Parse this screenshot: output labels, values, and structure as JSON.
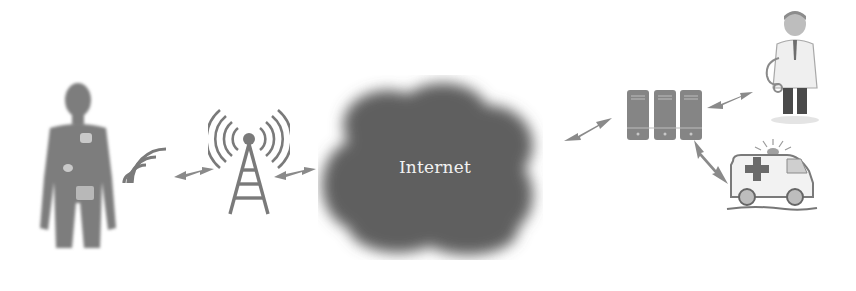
{
  "diagram": {
    "title": "",
    "nodes": [
      {
        "id": "patient",
        "label": "",
        "icon": "patient-with-body-sensors-icon"
      },
      {
        "id": "signal",
        "label": "",
        "icon": "wireless-signal-icon"
      },
      {
        "id": "tower",
        "label": "",
        "icon": "cell-tower-icon"
      },
      {
        "id": "internet",
        "label": "Internet",
        "icon": "cloud-icon"
      },
      {
        "id": "servers",
        "label": "",
        "icon": "server-rack-icon"
      },
      {
        "id": "doctor",
        "label": "",
        "icon": "doctor-icon"
      },
      {
        "id": "ambulance",
        "label": "",
        "icon": "ambulance-icon"
      }
    ],
    "edges": [
      {
        "from": "patient",
        "to": "tower",
        "style": "bidirectional-wireless"
      },
      {
        "from": "tower",
        "to": "internet",
        "style": "bidirectional-wireless"
      },
      {
        "from": "internet",
        "to": "servers",
        "style": "bidirectional-wireless"
      },
      {
        "from": "servers",
        "to": "doctor",
        "style": "bidirectional-wireless"
      },
      {
        "from": "servers",
        "to": "ambulance",
        "style": "bidirectional-wireless"
      }
    ],
    "colors": {
      "cloud": "#5e5e5e",
      "figure": "#7a7a7a",
      "background": "#ffffff",
      "label": "#f2f2f2"
    }
  }
}
